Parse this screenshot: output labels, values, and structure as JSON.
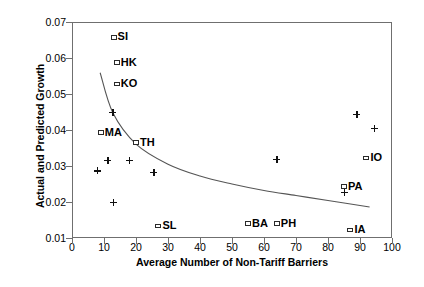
{
  "chart_data": {
    "type": "scatter",
    "title": "",
    "xlabel": "Average Number of Non-Tariff Barriers",
    "ylabel": "Actual and Predicted Growth",
    "xlim": [
      0,
      100
    ],
    "ylim": [
      0.01,
      0.07
    ],
    "xticks": [
      0,
      10,
      20,
      30,
      40,
      50,
      60,
      70,
      80,
      90,
      100
    ],
    "xtick_labels": [
      "0",
      "10",
      "20",
      "30",
      "40",
      "50",
      "60",
      "70",
      "80",
      "90",
      "100"
    ],
    "yticks": [
      0.01,
      0.02,
      0.03,
      0.04,
      0.05,
      0.06,
      0.07
    ],
    "ytick_labels": [
      "0.01",
      "0.02",
      "0.03",
      "0.04",
      "0.05",
      "0.06",
      "0.07"
    ],
    "grid": false,
    "legend": "none",
    "series": [
      {
        "name": "Labeled countries (square markers)",
        "marker": "open-square",
        "points": [
          {
            "label": "SI",
            "x": 13,
            "y": 0.0657
          },
          {
            "label": "HK",
            "x": 14,
            "y": 0.0587
          },
          {
            "label": "KO",
            "x": 14,
            "y": 0.0528
          },
          {
            "label": "MA",
            "x": 9,
            "y": 0.0393
          },
          {
            "label": "TH",
            "x": 20,
            "y": 0.0365
          },
          {
            "label": "SL",
            "x": 27,
            "y": 0.0133
          },
          {
            "label": "BA",
            "x": 55,
            "y": 0.014
          },
          {
            "label": "PH",
            "x": 64,
            "y": 0.014
          },
          {
            "label": "PA",
            "x": 85,
            "y": 0.0243
          },
          {
            "label": "IO",
            "x": 92,
            "y": 0.0322
          },
          {
            "label": "IA",
            "x": 87,
            "y": 0.0122
          }
        ]
      },
      {
        "name": "Unlabeled observations (plus markers)",
        "marker": "plus",
        "points": [
          {
            "x": 12.8,
            "y": 0.045
          },
          {
            "x": 8.0,
            "y": 0.0287
          },
          {
            "x": 11.2,
            "y": 0.0315
          },
          {
            "x": 18.0,
            "y": 0.0315
          },
          {
            "x": 25.6,
            "y": 0.0283
          },
          {
            "x": 13.0,
            "y": 0.0199
          },
          {
            "x": 64.0,
            "y": 0.0318
          },
          {
            "x": 89.0,
            "y": 0.0444
          },
          {
            "x": 94.5,
            "y": 0.0405
          },
          {
            "x": 85.0,
            "y": 0.0227
          }
        ]
      },
      {
        "name": "Predicted growth (fitted curve)",
        "marker": "line",
        "points": [
          {
            "x": 8.8,
            "y": 0.0559
          },
          {
            "x": 12.8,
            "y": 0.0447
          },
          {
            "x": 20.0,
            "y": 0.0361
          },
          {
            "x": 30.0,
            "y": 0.0305
          },
          {
            "x": 40.0,
            "y": 0.0272
          },
          {
            "x": 50.0,
            "y": 0.025
          },
          {
            "x": 60.0,
            "y": 0.0232
          },
          {
            "x": 70.0,
            "y": 0.0218
          },
          {
            "x": 80.0,
            "y": 0.0204
          },
          {
            "x": 93.0,
            "y": 0.0186
          }
        ]
      }
    ]
  }
}
